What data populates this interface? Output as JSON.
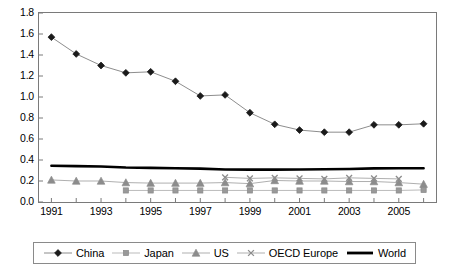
{
  "chart_data": {
    "type": "line",
    "title": "",
    "xlabel": "",
    "ylabel": "",
    "x": [
      1991,
      1992,
      1993,
      1994,
      1995,
      1996,
      1997,
      1998,
      1999,
      2000,
      2001,
      2002,
      2003,
      2004,
      2005,
      2006
    ],
    "xtick_labels": [
      "1991",
      "1993",
      "1995",
      "1997",
      "1999",
      "2001",
      "2003",
      "2005"
    ],
    "xtick_values": [
      1991,
      1993,
      1995,
      1997,
      1999,
      2001,
      2003,
      2005
    ],
    "xlim": [
      1990.5,
      2006.5
    ],
    "ytick_labels": [
      "0.0",
      "0.2",
      "0.4",
      "0.6",
      "0.8",
      "1.0",
      "1.2",
      "1.4",
      "1.6",
      "1.8"
    ],
    "ytick_values": [
      0.0,
      0.2,
      0.4,
      0.6,
      0.8,
      1.0,
      1.2,
      1.4,
      1.6,
      1.8
    ],
    "ylim": [
      0.0,
      1.8
    ],
    "grid": false,
    "legend_position": "bottom",
    "series": [
      {
        "name": "China",
        "marker": "diamond",
        "color": "#1a1a1a",
        "line_color": "#808080",
        "x": [
          1991,
          1992,
          1993,
          1994,
          1995,
          1996,
          1997,
          1998,
          1999,
          2000,
          2001,
          2002,
          2003,
          2004,
          2005,
          2006
        ],
        "values": [
          1.57,
          1.41,
          1.3,
          1.23,
          1.24,
          1.15,
          1.01,
          1.02,
          0.85,
          0.74,
          0.685,
          0.665,
          0.665,
          0.735,
          0.735,
          0.745
        ]
      },
      {
        "name": "Japan",
        "marker": "square",
        "color": "#999999",
        "line_color": "#b3b3b3",
        "x": [
          1994,
          1995,
          1996,
          1997,
          1998,
          1999,
          2000,
          2001,
          2002,
          2003,
          2004,
          2005,
          2006
        ],
        "values": [
          0.11,
          0.11,
          0.11,
          0.11,
          0.11,
          0.11,
          0.11,
          0.11,
          0.11,
          0.11,
          0.11,
          0.11,
          0.115
        ]
      },
      {
        "name": "US",
        "marker": "triangle",
        "color": "#8c8c8c",
        "line_color": "#a6a6a6",
        "x": [
          1991,
          1992,
          1993,
          1994,
          1995,
          1996,
          1997,
          1998,
          1999,
          2000,
          2001,
          2002,
          2003,
          2004,
          2005,
          2006
        ],
        "values": [
          0.21,
          0.2,
          0.2,
          0.185,
          0.18,
          0.18,
          0.18,
          0.185,
          0.175,
          0.205,
          0.2,
          0.2,
          0.195,
          0.195,
          0.185,
          0.17
        ]
      },
      {
        "name": "OECD Europe",
        "marker": "x",
        "color": "#8c8c8c",
        "line_color": "#a6a6a6",
        "x": [
          1998,
          1999,
          2000,
          2001,
          2002,
          2003,
          2004,
          2005
        ],
        "values": [
          0.235,
          0.225,
          0.23,
          0.225,
          0.22,
          0.23,
          0.225,
          0.22
        ]
      },
      {
        "name": "World",
        "marker": "none",
        "color": "#000000",
        "line_color": "#000000",
        "x": [
          1991,
          1992,
          1993,
          1994,
          1995,
          1996,
          1997,
          1998,
          1999,
          2000,
          2001,
          2002,
          2003,
          2004,
          2005,
          2006
        ],
        "values": [
          0.345,
          0.342,
          0.338,
          0.328,
          0.325,
          0.322,
          0.318,
          0.31,
          0.308,
          0.308,
          0.31,
          0.312,
          0.315,
          0.32,
          0.322,
          0.322
        ]
      }
    ]
  },
  "legend": {
    "items": [
      {
        "label": "China",
        "marker": "diamond-marker-icon"
      },
      {
        "label": "Japan",
        "marker": "square-marker-icon"
      },
      {
        "label": "US",
        "marker": "triangle-marker-icon"
      },
      {
        "label": "OECD Europe",
        "marker": "x-marker-icon"
      },
      {
        "label": "World",
        "marker": "thick-line-icon"
      }
    ]
  }
}
